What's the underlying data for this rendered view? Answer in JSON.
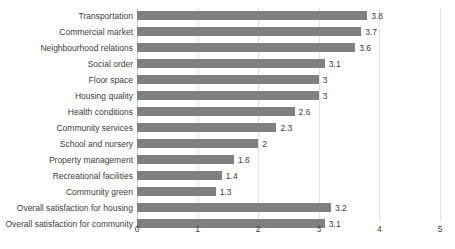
{
  "chart_data": {
    "type": "bar",
    "orientation": "horizontal",
    "title": "",
    "xlabel": "",
    "ylabel": "",
    "xlim": [
      0,
      5
    ],
    "xticks": [
      0,
      1,
      2,
      3,
      4,
      5
    ],
    "xtick_labels": [
      "0",
      "1",
      "2",
      "3",
      "4",
      "5"
    ],
    "grid": true,
    "legend": false,
    "bar_color": "#808080",
    "gridline_color": "#e3e3e3",
    "categories": [
      "Transportation",
      "Commercial market",
      "Neighbourhood relations",
      "Social order",
      "Floor space",
      "Housing quality",
      "Health conditions",
      "Community services",
      "School and nursery",
      "Property management",
      "Recreational facilities",
      "Community green",
      "Overall satisfaction for housing",
      "Overall satisfaction for community"
    ],
    "values": [
      3.8,
      3.7,
      3.6,
      3.1,
      3,
      3,
      2.6,
      2.3,
      2,
      1.6,
      1.4,
      1.3,
      3.2,
      3.1
    ],
    "value_labels": [
      "3.8",
      "3.7",
      "3.6",
      "3.1",
      "3",
      "3",
      "2.6",
      "2.3",
      "2",
      "1.6",
      "1.4",
      "1.3",
      "3.2",
      "3.1"
    ]
  }
}
